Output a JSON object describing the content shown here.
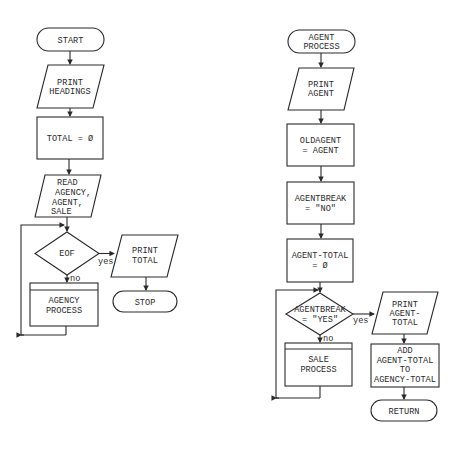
{
  "left_flowchart": {
    "start": "START",
    "print_headings": [
      "PRINT",
      "HEADINGS"
    ],
    "total_init": "TOTAL = Ø",
    "read": [
      "READ",
      "AGENCY,",
      "AGENT,",
      "SALE"
    ],
    "decision": "EOF",
    "yes_label": "yes",
    "no_label": "no",
    "agency_process": [
      "AGENCY",
      "PROCESS"
    ],
    "print_total": [
      "PRINT",
      "TOTAL"
    ],
    "stop": "STOP"
  },
  "right_flowchart": {
    "start": [
      "AGENT",
      "PROCESS"
    ],
    "print_agent": [
      "PRINT",
      "AGENT"
    ],
    "oldagent": [
      "OLDAGENT",
      "= AGENT"
    ],
    "agentbreak_init": [
      "AGENTBREAK",
      "= \"NO\""
    ],
    "agent_total_init": [
      "AGENT-TOTAL",
      "= Ø"
    ],
    "decision": [
      "AGENTBREAK",
      "= \"YES\""
    ],
    "yes_label": "yes",
    "no_label": "no",
    "sale_process": [
      "SALE",
      "PROCESS"
    ],
    "print_agent_total": [
      "PRINT",
      "AGENT-",
      "TOTAL"
    ],
    "add": [
      "ADD",
      "AGENT-TOTAL",
      "TO",
      "AGENCY-TOTAL"
    ],
    "return": "RETURN"
  }
}
